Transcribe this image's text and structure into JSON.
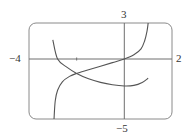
{
  "chart_data": {
    "type": "line",
    "title": "",
    "xlabel": "",
    "ylabel": "",
    "xlim": [
      -4,
      2
    ],
    "ylim": [
      -5,
      3
    ],
    "grid": false,
    "legend": null,
    "tick_labels": {
      "x_min": "−4",
      "x_max": "2",
      "y_max": "3",
      "y_min": "−5"
    },
    "minor_ticks_x": [
      -2
    ],
    "series": [
      {
        "name": "decreasing-curve",
        "points": [
          [
            -3.0,
            1.6
          ],
          [
            -2.8,
            0.0
          ],
          [
            -2.4,
            -0.7
          ],
          [
            -2.0,
            -1.2
          ],
          [
            -1.5,
            -1.65
          ],
          [
            -1.0,
            -1.95
          ],
          [
            -0.5,
            -2.15
          ],
          [
            0.0,
            -2.25
          ],
          [
            0.4,
            -2.2
          ],
          [
            0.75,
            -1.95
          ],
          [
            1.0,
            -1.6
          ]
        ]
      },
      {
        "name": "increasing-curve",
        "points": [
          [
            -2.95,
            -5.0
          ],
          [
            -2.9,
            -3.5
          ],
          [
            -2.8,
            -2.6
          ],
          [
            -2.6,
            -1.9
          ],
          [
            -2.3,
            -1.45
          ],
          [
            -2.0,
            -1.2
          ],
          [
            -1.5,
            -0.9
          ],
          [
            -1.0,
            -0.6
          ],
          [
            -0.5,
            -0.3
          ],
          [
            0.0,
            0.0
          ],
          [
            0.4,
            0.35
          ],
          [
            0.7,
            0.85
          ],
          [
            0.85,
            1.5
          ],
          [
            0.95,
            2.3
          ],
          [
            1.0,
            3.0
          ]
        ]
      }
    ]
  },
  "colors": {
    "frame": "#8a8a8a",
    "axes": "#6e6e6e",
    "curve": "#555555"
  }
}
